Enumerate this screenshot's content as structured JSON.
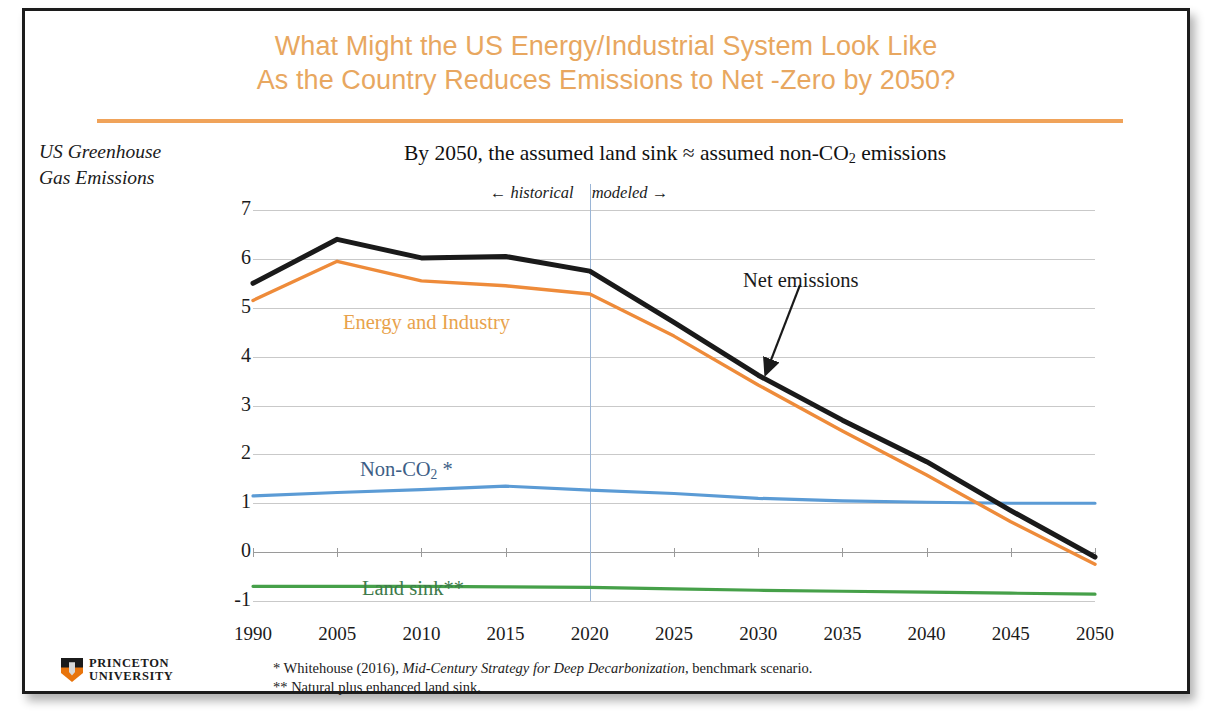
{
  "slide": {
    "title_line1": "What Might the US Energy/Industrial System Look Like",
    "title_line2": "As the Country Reduces Emissions to Net -Zero by 2050?",
    "title_color": "#E8A760",
    "rule_color": "#F0A35A",
    "left_caption_line1": "US Greenhouse",
    "left_caption_line2": "Gas Emissions"
  },
  "annotations": {
    "era_historical": "← historical",
    "era_modeled": "modeled →",
    "net_emissions_label": "Net emissions"
  },
  "footnotes": {
    "one_prefix": "* Whitehouse (2016), ",
    "one_italic": "Mid-Century Strategy for Deep Decarbonization",
    "one_suffix": ", benchmark scenario.",
    "two": "** Natural plus enhanced land sink."
  },
  "logo": {
    "line1": "PRINCETON",
    "line2": "UNIVERSITY",
    "shield_orange": "#E8740C",
    "shield_black": "#1b1b1b"
  },
  "chart_data": {
    "type": "line",
    "title": "By 2050, the assumed land sink ≈ assumed non-CO2 emissions",
    "title_parts": {
      "pre": "By 2050, the assumed land sink ≈ assumed non-CO",
      "sub": "2",
      "post": " emissions"
    },
    "xlabel": "",
    "ylabel": "Billion tCO2 equivalent",
    "ylabel_parts": {
      "pre": "Billion tCO",
      "sub": "2",
      "post": " equivalent"
    },
    "categories": [
      "1990",
      "2005",
      "2010",
      "2015",
      "2020",
      "2025",
      "2030",
      "2035",
      "2040",
      "2045",
      "2050"
    ],
    "ylim": [
      -1,
      7
    ],
    "yticks": [
      7,
      6,
      5,
      4,
      3,
      2,
      1,
      0,
      -1
    ],
    "ytick_labels": [
      "7",
      "6",
      "5",
      "4",
      "3",
      "2",
      "1",
      "0",
      "-1"
    ],
    "grid": true,
    "legend": "inline-labels",
    "divider_category": "2020",
    "divider_note": "boundary between historical and modeled data",
    "series": [
      {
        "name": "Net emissions",
        "color": "#1a1a1a",
        "label_color": "#1a1a1a",
        "width": 5,
        "values": [
          5.5,
          6.4,
          6.02,
          6.05,
          5.75,
          4.7,
          3.62,
          2.7,
          1.85,
          0.85,
          -0.1
        ]
      },
      {
        "name": "Energy and Industry",
        "color": "#EE8B3A",
        "label_color": "#E8A24C",
        "width": 3.4,
        "values": [
          5.15,
          5.95,
          5.55,
          5.45,
          5.28,
          4.42,
          3.42,
          2.48,
          1.58,
          0.62,
          -0.25
        ]
      },
      {
        "name": "Non-CO2 *",
        "label_parts": {
          "pre": "Non-CO",
          "sub": "2",
          "post": " *"
        },
        "color": "#5B9BD5",
        "label_color": "#3D5E86",
        "width": 3.2,
        "values": [
          1.15,
          1.22,
          1.28,
          1.35,
          1.27,
          1.2,
          1.1,
          1.05,
          1.02,
          1.0,
          1.0
        ]
      },
      {
        "name": "Land sink**",
        "color": "#46A049",
        "label_color": "#3E7A4B",
        "width": 3.2,
        "values": [
          -0.7,
          -0.7,
          -0.7,
          -0.71,
          -0.72,
          -0.75,
          -0.78,
          -0.8,
          -0.82,
          -0.84,
          -0.86
        ]
      }
    ]
  }
}
